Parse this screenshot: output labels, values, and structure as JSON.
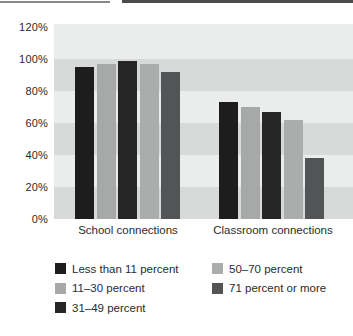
{
  "figure": {
    "kind": "grayscale grouped bar chart (print figure)",
    "background_color": "#ffffff",
    "band_light_color": "#ebedec",
    "band_dark_color": "#d8dad9"
  },
  "chart_data": {
    "type": "bar",
    "title": "",
    "xlabel": "",
    "ylabel": "",
    "groups": [
      "School connections",
      "Classroom connections"
    ],
    "series": [
      {
        "name": "Less than 11 percent",
        "color": "#1d1d1d",
        "values": [
          95,
          73
        ]
      },
      {
        "name": "11–30 percent",
        "color": "#a7a9a8",
        "values": [
          97,
          70
        ]
      },
      {
        "name": "31–49 percent",
        "color": "#262626",
        "values": [
          99,
          67
        ]
      },
      {
        "name": "50–70 percent",
        "color": "#abadac",
        "values": [
          97,
          62
        ]
      },
      {
        "name": "71 percent or more",
        "color": "#525456",
        "values": [
          92,
          38
        ]
      }
    ],
    "y_ticks": [
      "120%",
      "100%",
      "80%",
      "60%",
      "40%",
      "20%",
      "0%"
    ],
    "ylim": [
      0,
      120
    ],
    "grid": "alternating horizontal shaded bands every 20%",
    "legend_position": "below chart, two columns (3 items left, 2 items right)"
  }
}
